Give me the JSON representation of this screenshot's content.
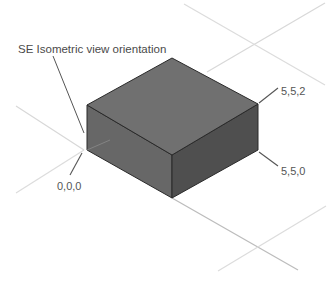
{
  "diagram": {
    "title": "SE Isometric view orientation",
    "labels": {
      "top_corner": "5,5,2",
      "bottom_corner": "5,5,0",
      "origin": "0,0,0"
    },
    "colors": {
      "top_face": "#6e6e6e",
      "left_face": "#666666",
      "right_face": "#505050",
      "edge": "#2a2a2a",
      "grid_light": "#d8d8d8",
      "grid_medium": "#bcbcbc",
      "leader": "#555555"
    }
  }
}
